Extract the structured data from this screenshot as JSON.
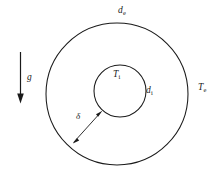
{
  "figure": {
    "background_color": "#ffffff",
    "stroke_color": "#1a1a1a",
    "width": 218,
    "height": 174
  },
  "labels": {
    "outer_diameter": {
      "symbol": "d",
      "subscript": "e",
      "name": "outer diameter"
    },
    "inner_diameter": {
      "symbol": "d",
      "subscript": "i",
      "name": "inner diameter"
    },
    "outer_temperature": {
      "symbol": "T",
      "subscript": "e",
      "name": "outer wall temperature"
    },
    "inner_temperature": {
      "symbol": "T",
      "subscript": "i",
      "name": "inner wall temperature"
    },
    "gap_width": {
      "symbol": "δ",
      "subscript": "",
      "name": "annular gap width"
    },
    "gravity": {
      "symbol": "g",
      "subscript": "",
      "name": "gravitational acceleration"
    }
  },
  "geometry": {
    "outer_circle": {
      "cx": 117,
      "cy": 94,
      "r": 71
    },
    "inner_circle": {
      "cx": 120,
      "cy": 91,
      "r": 26
    },
    "gap_arrow": {
      "x1": 73,
      "y1": 143,
      "x2": 102,
      "y2": 112
    },
    "gravity_arrow": {
      "x": 20,
      "y1": 52,
      "y2": 103,
      "direction": "down"
    }
  }
}
